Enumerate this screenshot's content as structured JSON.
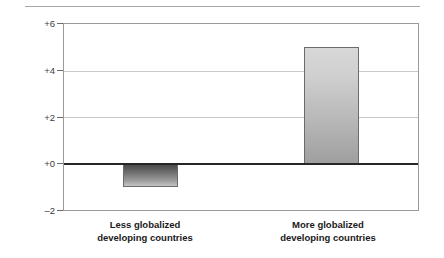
{
  "chart_data": {
    "type": "bar",
    "title": "",
    "xlabel": "",
    "ylabel": "Percent",
    "categories": [
      "Less globalized developing countries",
      "More globalized developing countries"
    ],
    "category_lines": [
      [
        "Less globalized",
        "developing countries"
      ],
      [
        "More globalized",
        "developing countries"
      ]
    ],
    "values": [
      -1,
      5
    ],
    "ylim": [
      -2,
      6
    ],
    "yticks": [
      6,
      4,
      2,
      0,
      -2
    ],
    "ytick_labels": [
      "+6",
      "+4",
      "+2",
      "+0",
      "–2"
    ],
    "grid": true,
    "gridlines_at": [
      4,
      2
    ],
    "zero_line": 0,
    "legend": "",
    "colors": {
      "bar_negative_top": "#4a4a4a",
      "bar_negative_bottom": "#c4c4c4",
      "bar_positive_top": "#d8d8d8",
      "bar_positive_bottom": "#9f9f9f",
      "bar_border": "#6b6b6b",
      "zero_line": "#262626",
      "gridline": "#c9c9c9",
      "frame": "#9a9a9a",
      "text": "#1a1a1a",
      "background": "#ffffff"
    }
  },
  "axis": {
    "ylabel": "Percent",
    "ticks": {
      "t6": "+6",
      "t4": "+4",
      "t2": "+2",
      "t0": "+0",
      "tm2": "–2"
    }
  },
  "categories": {
    "left": {
      "line1": "Less globalized",
      "line2": "developing countries"
    },
    "right": {
      "line1": "More globalized",
      "line2": "developing countries"
    }
  }
}
